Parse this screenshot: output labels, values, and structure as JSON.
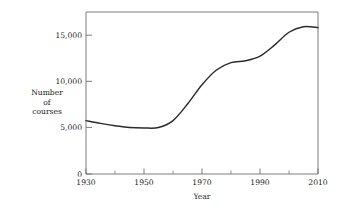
{
  "chart_data": {
    "type": "line",
    "title": "",
    "subtitle": "",
    "xlabel": "Year",
    "ylabel": "Number of courses",
    "ylabel_lines": [
      "Number",
      "of",
      "courses"
    ],
    "xlim": [
      1930,
      2010
    ],
    "ylim": [
      0,
      17600
    ],
    "grid": false,
    "legend": null,
    "x_major_ticks": [
      1930,
      1950,
      1970,
      1990,
      2010
    ],
    "x_major_tick_labels": [
      "1930",
      "1950",
      "1970",
      "1990",
      "2010"
    ],
    "x_minor_ticks": [
      1940,
      1960,
      1980,
      2000
    ],
    "y_major_ticks": [
      0,
      5000,
      10000,
      15000
    ],
    "y_major_tick_labels": [
      "0",
      "5,000",
      "10,000",
      "15,000"
    ],
    "line_color": "#2b2b2b",
    "axis_color": "#6e6e6e",
    "series": [
      {
        "name": "Number of courses",
        "x": [
          1930,
          1935,
          1940,
          1945,
          1950,
          1955,
          1960,
          1965,
          1970,
          1975,
          1980,
          1985,
          1990,
          1995,
          2000,
          2005,
          2010
        ],
        "values": [
          5800,
          5500,
          5250,
          5050,
          5000,
          5050,
          5800,
          7600,
          9700,
          11300,
          12100,
          12300,
          12800,
          14000,
          15400,
          16000,
          15900
        ]
      }
    ],
    "annotations": []
  }
}
